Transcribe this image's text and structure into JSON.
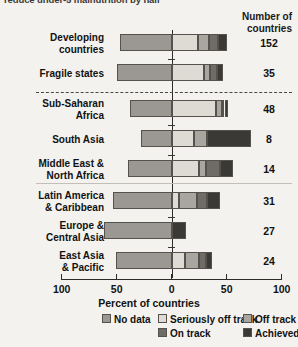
{
  "title": "reduce under-5 malnutrition by half",
  "header": {
    "count_column_line1": "Number of",
    "count_column_line2": "countries"
  },
  "axis": {
    "title": "Percent of countries",
    "ticks": [
      "100",
      "50",
      "0",
      "50",
      "100"
    ],
    "tick_values": [
      -100,
      -50,
      0,
      50,
      100
    ],
    "range": [
      -100,
      100
    ]
  },
  "legend": {
    "items": [
      {
        "label": "No data",
        "color": "#9b9893"
      },
      {
        "label": "Seriously off track",
        "color": "#dedbd4"
      },
      {
        "label": "Off track",
        "color": "#a9a6a0"
      },
      {
        "label": "On track",
        "color": "#6f6c68"
      },
      {
        "label": "Achieved",
        "color": "#3b3936"
      }
    ]
  },
  "chart_data": {
    "type": "bar",
    "subtype": "diverging-stacked-horizontal",
    "title": "reduce under-5 malnutrition by half",
    "xlabel": "Percent of countries",
    "ylabel": "",
    "xlim": [
      -100,
      100
    ],
    "grid": false,
    "legend_position": "bottom",
    "note": "No data extends left of zero; the four progress categories stack rightward from zero.",
    "categories": [
      "Developing countries",
      "Fragile states",
      "Sub-Saharan Africa",
      "South Asia",
      "Middle East & North Africa",
      "Latin America & Caribbean",
      "Europe & Central Asia",
      "East Asia & Pacific"
    ],
    "series": [
      {
        "name": "No data",
        "values": [
          -47,
          -50,
          -38,
          -28,
          -40,
          -53,
          -62,
          -51
        ]
      },
      {
        "name": "Seriously off track",
        "values": [
          24,
          29,
          40,
          20,
          25,
          7,
          0,
          12
        ]
      },
      {
        "name": "Off track",
        "values": [
          10,
          6,
          6,
          12,
          6,
          16,
          0,
          13
        ]
      },
      {
        "name": "On track",
        "values": [
          8,
          6,
          2,
          0,
          13,
          9,
          0,
          6
        ]
      },
      {
        "name": "Achieved",
        "values": [
          8,
          6,
          3,
          40,
          12,
          12,
          13,
          6
        ]
      }
    ]
  },
  "rows": [
    {
      "label_line1": "Developing",
      "label_line2": "countries",
      "count": "152"
    },
    {
      "label_line1": "Fragile states",
      "label_line2": "",
      "count": "35"
    },
    {
      "label_line1": "Sub-Saharan",
      "label_line2": "Africa",
      "count": "48"
    },
    {
      "label_line1": "South Asia",
      "label_line2": "",
      "count": "8"
    },
    {
      "label_line1": "Middle East &",
      "label_line2": "North Africa",
      "count": "14"
    },
    {
      "label_line1": "Latin America",
      "label_line2": "& Caribbean",
      "count": "31"
    },
    {
      "label_line1": "Europe &",
      "label_line2": "Central Asia",
      "count": "27"
    },
    {
      "label_line1": "East Asia",
      "label_line2": "& Pacific",
      "count": "24"
    }
  ]
}
